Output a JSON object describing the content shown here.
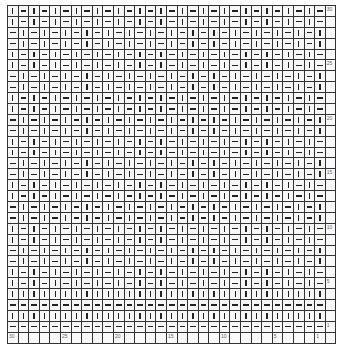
{
  "chart": {
    "title": "",
    "columns": 30,
    "rows": 30,
    "legend": {
      "knit_symbol": "|",
      "purl_symbol": "—"
    },
    "column_labels": {
      "30": "30",
      "25": "25",
      "20": "20",
      "15": "15",
      "10": "10",
      "5": "5",
      "1": "1"
    },
    "row_labels": {
      "30": "30",
      "25": "25",
      "20": "20",
      "15": "15",
      "10": "10",
      "5": "5",
      "1": "1"
    },
    "pattern_note": "Rows 5-30: 1x1 alternating knit/purl, offset every 2 rows; rows 1-4: alternating full purl/knit rows",
    "rows_data": {
      "30": "K P K P K P K P K P K P K P K P K P K P K P K P K P K P K P",
      "29": "K P K P K P K P K P K P K P K P K P K P K P K P K P K P K P",
      "28": "P K P K P K P K P K P K P K P K P K P K P K P K P K P K P K",
      "27": "P K P K P K P K P K P K P K P K P K P K P K P K P K P K P K",
      "26": "K P K P K P K P K P K P K P K P K P K P K P K P K P K P K P",
      "25": "K P K P K P K P K P K P K P K P K P K P K P K P K P K P K P",
      "24": "P K P K P K P K P K P K P K P K P K P K P K P K P K P K P K",
      "23": "P K P K P K P K P K P K P K P K P K P K P K P K P K P K P K",
      "22": "K P K P K P K P K P K P K P K P K P K P K P K P K P K P K P",
      "21": "K P K P K P K P K P K P K P K P K P K P K P K P K P K P K P",
      "20": "P K P K P K P K P K P K P K P K P K P K P K P K P K P K P K",
      "19": "P K P K P K P K P K P K P K P K P K P K P K P K P K P K P K",
      "18": "K P K P K P K P K P K P K P K P K P K P K P K P K P K P K P",
      "17": "K P K P K P K P K P K P K P K P K P K P K P K P K P K P K P",
      "16": "P K P K P K P K P K P K P K P K P K P K P K P K P K P K P K",
      "15": "P K P K P K P K P K P K P K P K P K P K P K P K P K P K P K",
      "14": "K P K P K P K P K P K P K P K P K P K P K P K P K P K P K P",
      "13": "K P K P K P K P K P K P K P K P K P K P K P K P K P K P K P",
      "12": "P K P K P K P K P K P K P K P K P K P K P K P K P K P K P K",
      "11": "P K P K P K P K P K P K P K P K P K P K P K P K P K P K P K",
      "10": "K P K P K P K P K P K P K P K P K P K P K P K P K P K P K P",
      "9": "K P K P K P K P K P K P K P K P K P K P K P K P K P K P K P",
      "8": "P K P K P K P K P K P K P K P K P K P K P K P K P K P K P K",
      "7": "P K P K P K P K P K P K P K P K P K P K P K P K P K P K P K",
      "6": "K P K P K P K P K P K P K P K P K P K P K P K P K P K P K P",
      "5": "K P K P K P K P K P K P K P K P K P K P K P K P K P K P K P",
      "4": "K K K K K K K K K K K K K K K K K K K K K K K K K K K K K K",
      "3": "P P P P P P P P P P P P P P P P P P P P P P P P P P P P P P",
      "2": "K K K K K K K K K K K K K K K K K K K K K K K K K K K K K K",
      "1": "P P P P P P P P P P P P P P P P P P P P P P P P P P P P P P"
    }
  }
}
